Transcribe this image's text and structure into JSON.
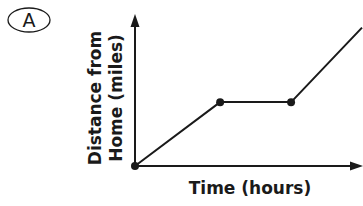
{
  "option": {
    "letter": "A"
  },
  "chart_data": {
    "type": "line",
    "title": "",
    "xlabel": "Time (hours)",
    "ylabel_lines": [
      "Distance from",
      "Home (miles)"
    ],
    "ylabel": "Distance from Home (miles)",
    "grid": false,
    "legend": null,
    "x_ticks": [],
    "y_ticks": [],
    "points": [
      {
        "x": 0,
        "y": 0,
        "marker": true
      },
      {
        "x": 3,
        "y": 3,
        "marker": true
      },
      {
        "x": 5.5,
        "y": 3,
        "marker": true
      },
      {
        "x": 8,
        "y": 6.5,
        "marker": false
      }
    ],
    "segments": [
      {
        "from": 0,
        "to": 1,
        "behavior": "increasing"
      },
      {
        "from": 1,
        "to": 2,
        "behavior": "constant"
      },
      {
        "from": 2,
        "to": 3,
        "behavior": "increasing"
      }
    ],
    "xlim": [
      0,
      8
    ],
    "ylim": [
      0,
      7
    ]
  },
  "colors": {
    "ink": "#1a1a1a",
    "background": "#ffffff"
  }
}
